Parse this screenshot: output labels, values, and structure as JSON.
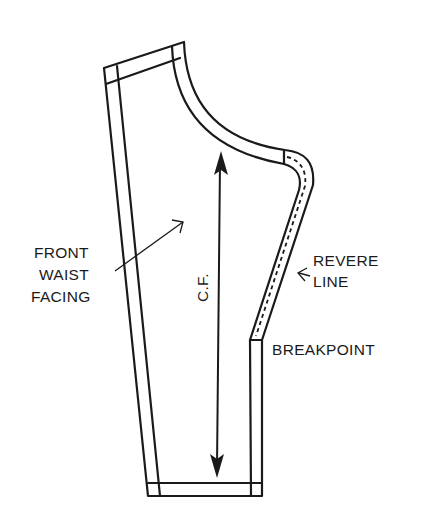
{
  "diagram": {
    "stroke_color": "#1a1a1a",
    "background": "#ffffff",
    "labels": {
      "piece_name": [
        "FRONT",
        "WAIST",
        "FACING"
      ],
      "center_front": "C.F.",
      "revere_line": [
        "REVERE",
        "LINE"
      ],
      "breakpoint": "BREAKPOINT"
    }
  }
}
